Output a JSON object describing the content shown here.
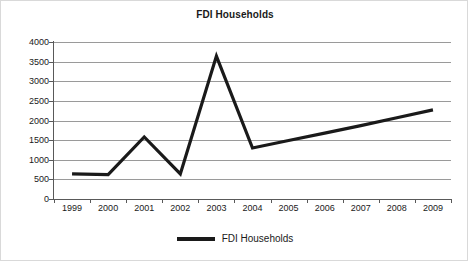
{
  "chart_data": {
    "type": "line",
    "title": "FDI Households",
    "xlabel": "",
    "ylabel": "",
    "categories": [
      "1999",
      "2000",
      "2001",
      "2002",
      "2003",
      "2004",
      "2005",
      "2006",
      "2007",
      "2008",
      "2009"
    ],
    "series": [
      {
        "name": "FDI Households",
        "values": [
          640,
          620,
          1580,
          640,
          3640,
          1300,
          1490,
          1680,
          1870,
          2070,
          2270
        ],
        "color": "#1a1a1a"
      }
    ],
    "ylim": [
      0,
      4000
    ],
    "ytick_labels": [
      "4000",
      "3500",
      "3000",
      "2500",
      "2000",
      "1500",
      "1000",
      "500",
      "0"
    ],
    "ytick_values": [
      4000,
      3500,
      3000,
      2500,
      2000,
      1500,
      1000,
      500,
      0
    ],
    "ytick_step": 500,
    "grid": true,
    "grid_color": "#9a9a9a",
    "axis_color": "#595959",
    "legend_position": "bottom",
    "legend_entries": [
      "FDI Households"
    ],
    "background": "#ffffff"
  }
}
